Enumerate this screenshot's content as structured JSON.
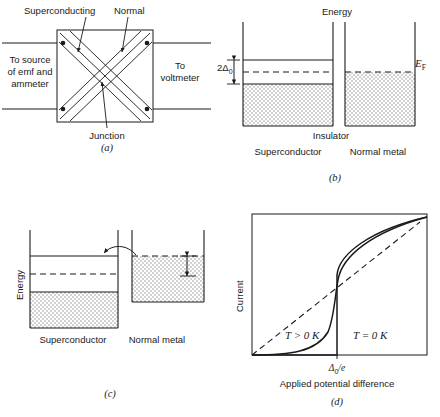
{
  "figure": {
    "panels": [
      "a",
      "b",
      "c",
      "d"
    ]
  },
  "panel_a": {
    "label": "(a)",
    "top_left_label": "Superconducting",
    "top_right_label": "Normal",
    "left_text": [
      "To source",
      "of emf and",
      "ammeter"
    ],
    "right_text": [
      "To",
      "voltmeter"
    ],
    "bottom_label": "Junction"
  },
  "panel_b": {
    "label": "(b)",
    "energy_axis_label": "Energy",
    "gap_label": "2Δ0",
    "gap_label_main": "2Δ",
    "gap_label_sub": "0",
    "fermi_label": "EF",
    "fermi_label_main": "E",
    "fermi_label_sub": "F",
    "insulator_label": "Insulator",
    "left_well_label": "Superconductor",
    "right_well_label": "Normal metal"
  },
  "panel_c": {
    "label": "(c)",
    "energy_axis_label": "Energy",
    "bias_label": "eV",
    "left_well_label": "Superconductor",
    "right_well_label": "Normal metal",
    "tunneling_arrow": "curved-arrow-icon"
  },
  "panel_d": {
    "label": "(d)",
    "ylabel": "Current",
    "xlabel": "Applied potential difference",
    "xtick_label": "Δ0/e",
    "xtick_label_main": "Δ",
    "xtick_label_sub": "0",
    "xtick_label_tail": "/e",
    "curve_warm_label": "T > 0 K",
    "curve_zero_label": "T = 0 K",
    "ohmic_line_style": "dashed"
  },
  "colors": {
    "ink": "#1a1a1a",
    "fill": "#d7d7d7",
    "paper": "#ffffff"
  }
}
